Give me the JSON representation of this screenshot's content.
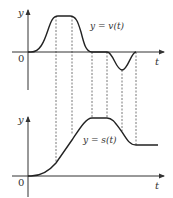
{
  "diagram": {
    "title": "",
    "colors": {
      "curve": "#222222",
      "axis": "#333333",
      "guide": "#555555"
    },
    "top_graph": {
      "y_axis_label": "y",
      "t_axis_label": "t",
      "origin_label": "0",
      "curve_label": "y = v(t)"
    },
    "bottom_graph": {
      "y_axis_label": "y",
      "t_axis_label": "t",
      "origin_label": "0",
      "curve_label": "y = s(t)"
    },
    "guide_line_count": 6
  }
}
